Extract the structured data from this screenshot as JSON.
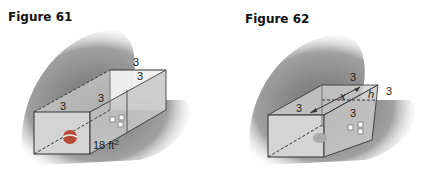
{
  "figures": [
    {
      "title": "Figure 61",
      "labels": {
        "top_back": "3",
        "top_diag": "3",
        "front_top": "3",
        "front_right_top": "3",
        "area": "18 ft",
        "area_sup": "2"
      }
    },
    {
      "title": "Figure 62",
      "labels": {
        "top_back": "3",
        "front_top": "3",
        "right_mid": "3",
        "x": "x",
        "h": "h",
        "side": "3"
      }
    }
  ],
  "colors": {
    "shadow": "#8a8a8a",
    "box_face": "#d6d6d6",
    "edge": "#333333",
    "ball": "#b84a3a"
  }
}
